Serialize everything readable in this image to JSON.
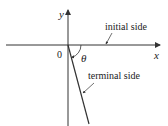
{
  "diagram": {
    "axes": {
      "x_label": "x",
      "y_label": "y",
      "origin_label": "0"
    },
    "angle_label": "θ",
    "annotations": {
      "initial_side": "initial side",
      "terminal_side": "terminal side"
    },
    "colors": {
      "line": "#333333",
      "text": "#222222",
      "background": "#ffffff"
    }
  }
}
